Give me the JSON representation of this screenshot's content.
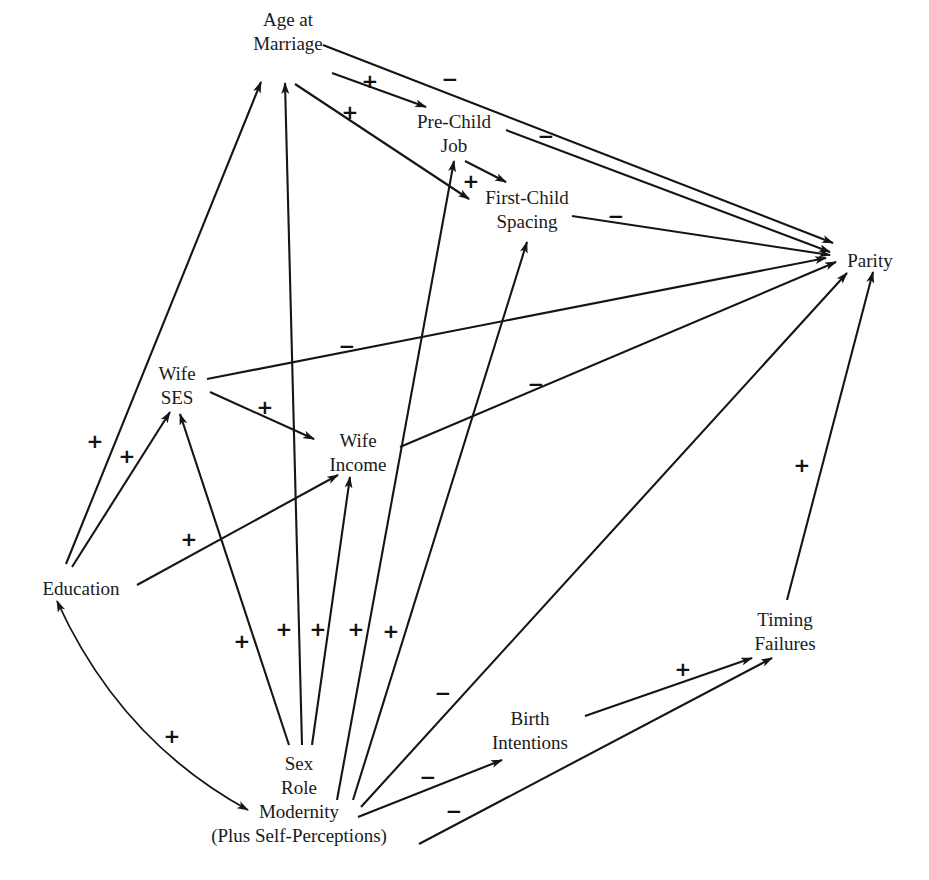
{
  "diagram": {
    "type": "path-diagram",
    "nodes": [
      {
        "id": "age_marriage",
        "lines": [
          "Age at",
          "Marriage"
        ],
        "x": 288,
        "y": 22,
        "anchor": "middle"
      },
      {
        "id": "pre_child_job",
        "lines": [
          "Pre-Child",
          "Job"
        ],
        "x": 454,
        "y": 124,
        "anchor": "middle"
      },
      {
        "id": "first_child_spacing",
        "lines": [
          "First-Child",
          "Spacing"
        ],
        "x": 527,
        "y": 200,
        "anchor": "middle"
      },
      {
        "id": "parity",
        "lines": [
          "Parity"
        ],
        "x": 870,
        "y": 263,
        "anchor": "middle"
      },
      {
        "id": "wife_ses",
        "lines": [
          "Wife",
          "SES"
        ],
        "x": 177,
        "y": 376,
        "anchor": "middle"
      },
      {
        "id": "wife_income",
        "lines": [
          "Wife",
          "Income"
        ],
        "x": 358,
        "y": 443,
        "anchor": "middle"
      },
      {
        "id": "education",
        "lines": [
          "Education"
        ],
        "x": 81,
        "y": 591,
        "anchor": "middle"
      },
      {
        "id": "timing_failures",
        "lines": [
          "Timing",
          "Failures"
        ],
        "x": 785,
        "y": 622,
        "anchor": "middle"
      },
      {
        "id": "birth_intentions",
        "lines": [
          "Birth",
          "Intentions"
        ],
        "x": 530,
        "y": 721,
        "anchor": "middle"
      },
      {
        "id": "sex_role_modernity",
        "lines": [
          "Sex",
          "Role",
          "Modernity",
          "(Plus Self-Perceptions)"
        ],
        "x": 299,
        "y": 766,
        "anchor": "middle"
      }
    ],
    "edges": [
      {
        "from": "age_marriage",
        "to": "parity",
        "sign": "−",
        "x1": 323,
        "y1": 45,
        "x2": 833,
        "y2": 243,
        "sx": 450,
        "sy": 80
      },
      {
        "from": "age_marriage",
        "to": "pre_child_job",
        "sign": "+",
        "x1": 332,
        "y1": 73,
        "x2": 426,
        "y2": 107,
        "sx": 370,
        "sy": 82
      },
      {
        "from": "age_marriage",
        "to": "first_child_spacing",
        "sign": "+",
        "x1": 295,
        "y1": 84,
        "x2": 469,
        "y2": 199,
        "sx": 350,
        "sy": 113
      },
      {
        "from": "pre_child_job",
        "to": "parity",
        "sign": "−",
        "x1": 506,
        "y1": 130,
        "x2": 830,
        "y2": 252,
        "sx": 546,
        "sy": 137
      },
      {
        "from": "pre_child_job",
        "to": "first_child_spacing",
        "sign": "+",
        "x1": 465,
        "y1": 161,
        "x2": 506,
        "y2": 182,
        "sx": 471,
        "sy": 182
      },
      {
        "from": "first_child_spacing",
        "to": "parity",
        "sign": "−",
        "x1": 572,
        "y1": 216,
        "x2": 830,
        "y2": 255,
        "sx": 616,
        "sy": 217
      },
      {
        "from": "wife_ses",
        "to": "parity",
        "sign": "−",
        "x1": 207,
        "y1": 379,
        "x2": 826,
        "y2": 258,
        "sx": 347,
        "sy": 347
      },
      {
        "from": "wife_ses",
        "to": "wife_income",
        "sign": "+",
        "x1": 210,
        "y1": 392,
        "x2": 314,
        "y2": 439,
        "sx": 265,
        "sy": 408
      },
      {
        "from": "wife_income",
        "to": "parity",
        "sign": "−",
        "x1": 400,
        "y1": 447,
        "x2": 836,
        "y2": 262,
        "sx": 536,
        "sy": 385
      },
      {
        "from": "education",
        "to": "age_marriage",
        "sign": "+",
        "x1": 66,
        "y1": 564,
        "x2": 261,
        "y2": 82,
        "sx": 95,
        "sy": 442
      },
      {
        "from": "education",
        "to": "wife_ses",
        "sign": "+",
        "x1": 72,
        "y1": 567,
        "x2": 170,
        "y2": 412,
        "sx": 127,
        "sy": 457
      },
      {
        "from": "education",
        "to": "wife_income",
        "sign": "+",
        "x1": 137,
        "y1": 585,
        "x2": 338,
        "y2": 475,
        "sx": 189,
        "sy": 540
      },
      {
        "from": "sex_role_modernity",
        "to": "wife_ses",
        "sign": "+",
        "x1": 289,
        "y1": 745,
        "x2": 180,
        "y2": 414,
        "sx": 242,
        "sy": 642
      },
      {
        "from": "sex_role_modernity",
        "to": "age_marriage",
        "sign": "+",
        "x1": 302,
        "y1": 745,
        "x2": 285,
        "y2": 83,
        "sx": 284,
        "sy": 630
      },
      {
        "from": "sex_role_modernity",
        "to": "wife_income",
        "sign": "+",
        "x1": 312,
        "y1": 745,
        "x2": 350,
        "y2": 477,
        "sx": 318,
        "sy": 630
      },
      {
        "from": "sex_role_modernity",
        "to": "pre_child_job",
        "sign": "+",
        "x1": 337,
        "y1": 800,
        "x2": 454,
        "y2": 161,
        "sx": 356,
        "sy": 630
      },
      {
        "from": "sex_role_modernity",
        "to": "first_child_spacing",
        "sign": "+",
        "x1": 353,
        "y1": 800,
        "x2": 527,
        "y2": 242,
        "sx": 391,
        "sy": 632
      },
      {
        "from": "sex_role_modernity",
        "to": "parity",
        "sign": "−",
        "x1": 361,
        "y1": 807,
        "x2": 847,
        "y2": 273,
        "sx": 443,
        "sy": 694
      },
      {
        "from": "sex_role_modernity",
        "to": "birth_intentions",
        "sign": "−",
        "x1": 358,
        "y1": 817,
        "x2": 502,
        "y2": 760,
        "sx": 428,
        "sy": 778
      },
      {
        "from": "sex_role_modernity",
        "to": "timing_failures",
        "sign": "−",
        "x1": 419,
        "y1": 844,
        "x2": 772,
        "y2": 658,
        "sx": 454,
        "sy": 812
      },
      {
        "from": "birth_intentions",
        "to": "timing_failures",
        "sign": "+",
        "x1": 585,
        "y1": 716,
        "x2": 752,
        "y2": 658,
        "sx": 683,
        "sy": 670
      },
      {
        "from": "timing_failures",
        "to": "parity",
        "sign": "+",
        "x1": 787,
        "y1": 600,
        "x2": 873,
        "y2": 272,
        "sx": 802,
        "sy": 466
      }
    ],
    "bidirectional": [
      {
        "between": [
          "education",
          "sex_role_modernity"
        ],
        "sign": "+",
        "path": "M 57 601 Q 120 740 248 810",
        "sx": 172,
        "sy": 737
      }
    ]
  }
}
